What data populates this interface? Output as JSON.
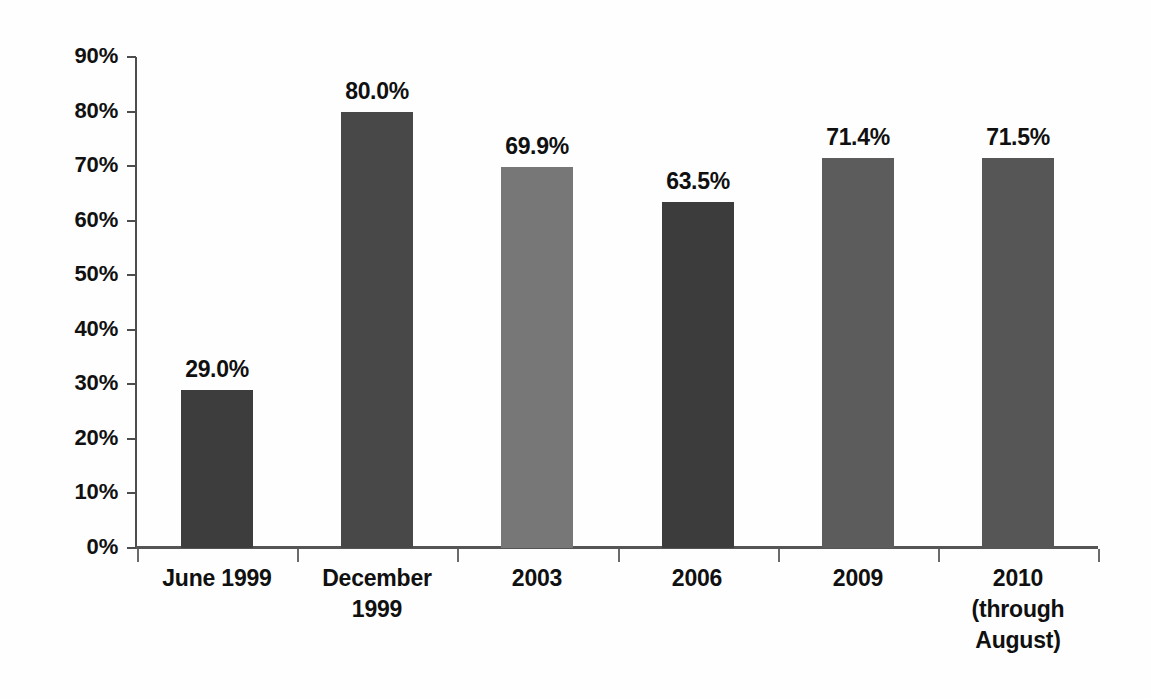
{
  "chart_data": {
    "type": "bar",
    "title": "",
    "subtitle": "",
    "xlabel": "",
    "ylabel": "",
    "categories": [
      "June 1999",
      "December\n1999",
      "2003",
      "2006",
      "2009",
      "2010\n(through\nAugust)"
    ],
    "values": [
      29.0,
      80.0,
      69.9,
      63.5,
      71.4,
      71.5
    ],
    "value_labels": [
      "29.0%",
      "80.0%",
      "69.9%",
      "63.5%",
      "71.4%",
      "71.5%"
    ],
    "bar_colors": [
      "#3d3d3d",
      "#484848",
      "#777777",
      "#3c3c3c",
      "#5c5c5c",
      "#565656"
    ],
    "ylim": [
      0,
      90
    ],
    "ytick_values": [
      90,
      80,
      70,
      60,
      50,
      40,
      30,
      20,
      10,
      0
    ],
    "ytick_labels": [
      "90%",
      "80%",
      "70%",
      "60%",
      "50%",
      "40%",
      "30%",
      "20%",
      "10%",
      "0%"
    ],
    "grid": false,
    "legend": "none",
    "units": "percent",
    "axis_color": "#4d4d4d",
    "background_color": "#ffffff",
    "text_color": "#101010"
  },
  "axis": {
    "y_axis_name": "percent-axis",
    "x_axis_name": "category-axis"
  }
}
